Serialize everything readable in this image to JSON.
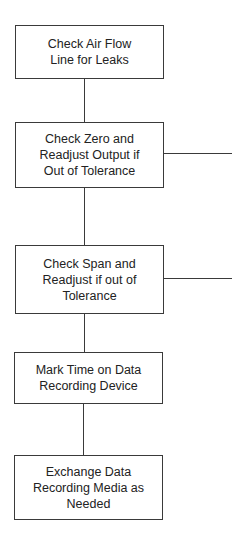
{
  "flowchart": {
    "steps": [
      {
        "label": "Check Air Flow\nLine for Leaks"
      },
      {
        "label": "Check Zero and\nReadjust Output if\nOut of Tolerance"
      },
      {
        "label": "Check Span and\nReadjust if out of\nTolerance"
      },
      {
        "label": "Mark Time on Data\nRecording Device"
      },
      {
        "label": "Exchange Data\nRecording Media as\nNeeded"
      }
    ],
    "connectors": [
      {
        "from": 0,
        "to": 1
      },
      {
        "from": 1,
        "to": 2
      },
      {
        "from": 2,
        "to": 3
      },
      {
        "from": 3,
        "to": 4
      }
    ],
    "side_branches": [
      {
        "from": 1,
        "direction": "right"
      },
      {
        "from": 2,
        "direction": "right"
      }
    ]
  }
}
